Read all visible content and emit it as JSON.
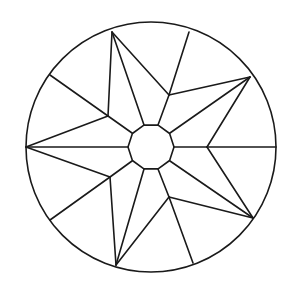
{
  "diagram": {
    "title": "",
    "stroke_color": "#1a1a1a",
    "background": "#ffffff",
    "stroke_width": 1.6,
    "circle": {
      "cx": 151,
      "cy": 147,
      "r": 125
    },
    "center_polygon": {
      "sides": 10,
      "cx": 151,
      "cy": 147,
      "r": 23,
      "rotation_deg": 0
    },
    "star_tips": [
      {
        "name": "tip-top",
        "x": 112,
        "y": 32
      },
      {
        "name": "tip-right-upper",
        "x": 250,
        "y": 77
      },
      {
        "name": "tip-right-lower",
        "x": 253,
        "y": 218
      },
      {
        "name": "tip-bottom",
        "x": 116,
        "y": 265
      },
      {
        "name": "tip-left",
        "x": 26,
        "y": 147
      }
    ],
    "star_valleys": [
      {
        "name": "valley-top-right",
        "x": 169,
        "y": 95
      },
      {
        "name": "valley-right",
        "x": 207,
        "y": 147
      },
      {
        "name": "valley-bottom-right",
        "x": 169,
        "y": 197
      },
      {
        "name": "valley-bottom-left",
        "x": 110,
        "y": 177
      },
      {
        "name": "valley-top-left",
        "x": 108,
        "y": 116
      }
    ],
    "rim_points": [
      {
        "name": "rim-top",
        "x": 189,
        "y": 32
      },
      {
        "name": "rim-right",
        "x": 276,
        "y": 147
      },
      {
        "name": "rim-bottom-right",
        "x": 193,
        "y": 263
      },
      {
        "name": "rim-bottom-left",
        "x": 50,
        "y": 220
      },
      {
        "name": "rim-top-left",
        "x": 50,
        "y": 75
      }
    ],
    "lines": [
      [
        112,
        32,
        169,
        95
      ],
      [
        169,
        95,
        250,
        77
      ],
      [
        250,
        77,
        207,
        147
      ],
      [
        207,
        147,
        253,
        218
      ],
      [
        253,
        218,
        169,
        197
      ],
      [
        169,
        197,
        116,
        265
      ],
      [
        116,
        265,
        110,
        177
      ],
      [
        110,
        177,
        26,
        147
      ],
      [
        26,
        147,
        108,
        116
      ],
      [
        108,
        116,
        112,
        32
      ],
      [
        169,
        95,
        189,
        32
      ],
      [
        207,
        147,
        276,
        147
      ],
      [
        169,
        197,
        193,
        263
      ],
      [
        110,
        177,
        50,
        220
      ],
      [
        108,
        116,
        50,
        75
      ],
      [
        174,
        147,
        207,
        147
      ],
      [
        170,
        133,
        250,
        77
      ],
      [
        158,
        125,
        169,
        95
      ],
      [
        144,
        125,
        112,
        32
      ],
      [
        132,
        133,
        108,
        116
      ],
      [
        128,
        147,
        26,
        147
      ],
      [
        132,
        161,
        110,
        177
      ],
      [
        144,
        169,
        116,
        265
      ],
      [
        158,
        169,
        169,
        197
      ],
      [
        170,
        161,
        253,
        218
      ]
    ]
  }
}
